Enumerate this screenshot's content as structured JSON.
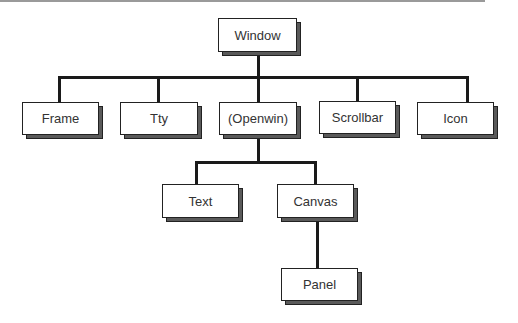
{
  "diagram": {
    "type": "class-hierarchy-tree",
    "nodes": {
      "window": "Window",
      "frame": "Frame",
      "tty": "Tty",
      "openwin": "(Openwin)",
      "scrollbar": "Scrollbar",
      "icon": "Icon",
      "text": "Text",
      "canvas": "Canvas",
      "panel": "Panel"
    },
    "edges": [
      [
        "Window",
        "Frame"
      ],
      [
        "Window",
        "Tty"
      ],
      [
        "Window",
        "(Openwin)"
      ],
      [
        "Window",
        "Scrollbar"
      ],
      [
        "Window",
        "Icon"
      ],
      [
        "(Openwin)",
        "Text"
      ],
      [
        "(Openwin)",
        "Canvas"
      ],
      [
        "Canvas",
        "Panel"
      ]
    ]
  }
}
